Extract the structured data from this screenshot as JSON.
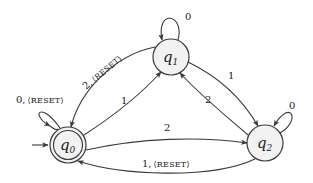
{
  "diagram": {
    "type": "finite-state-machine",
    "colors": {
      "stroke": "#3a3a3a",
      "state_fill": "#f2f2f2",
      "text": "#222222"
    },
    "states": [
      {
        "id": "q0",
        "base": "q",
        "sub": "0",
        "initial": true,
        "accepting": true,
        "cx": 68,
        "cy": 145
      },
      {
        "id": "q1",
        "base": "q",
        "sub": "1",
        "initial": false,
        "accepting": false,
        "cx": 171,
        "cy": 57
      },
      {
        "id": "q2",
        "base": "q",
        "sub": "2",
        "initial": false,
        "accepting": false,
        "cx": 265,
        "cy": 143
      }
    ],
    "transitions": [
      {
        "from": "q0",
        "to": "q0",
        "symbol": "0",
        "output": "RESET",
        "label": "0, ⟨RESET⟩"
      },
      {
        "from": "q1",
        "to": "q1",
        "symbol": "0",
        "output": "",
        "label": "0"
      },
      {
        "from": "q2",
        "to": "q2",
        "symbol": "0",
        "output": "",
        "label": "0"
      },
      {
        "from": "q0",
        "to": "q1",
        "symbol": "1",
        "output": "",
        "label": "1"
      },
      {
        "from": "q1",
        "to": "q0",
        "symbol": "2",
        "output": "RESET",
        "label": "2, ⟨RESET⟩"
      },
      {
        "from": "q1",
        "to": "q2",
        "symbol": "1",
        "output": "",
        "label": "1"
      },
      {
        "from": "q2",
        "to": "q1",
        "symbol": "2",
        "output": "",
        "label": "2"
      },
      {
        "from": "q0",
        "to": "q2",
        "symbol": "2",
        "output": "",
        "label": "2"
      },
      {
        "from": "q2",
        "to": "q0",
        "symbol": "1",
        "output": "RESET",
        "label": "1, ⟨RESET⟩"
      }
    ],
    "labels": {
      "q0_loop_prefix": "0,",
      "q0_loop_output": "⟨RESET⟩",
      "q1_loop": "0",
      "q2_loop": "0",
      "q0_to_q1": "1",
      "q1_to_q0_prefix": "2,",
      "q1_to_q0_output": "⟨RESET⟩",
      "q1_to_q2": "1",
      "q2_to_q1": "2",
      "q0_to_q2": "2",
      "q2_to_q0_prefix": "1,",
      "q2_to_q0_output": "⟨RESET⟩"
    },
    "state_text": {
      "q0_base": "q",
      "q0_sub": "0",
      "q1_base": "q",
      "q1_sub": "1",
      "q2_base": "q",
      "q2_sub": "2"
    }
  }
}
